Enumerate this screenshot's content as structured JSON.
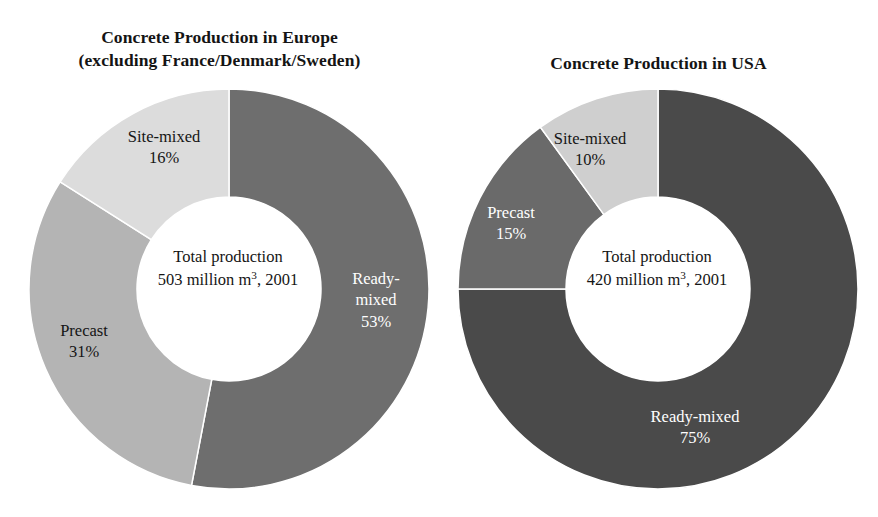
{
  "figure": {
    "background": "#ffffff"
  },
  "chart_data": [
    {
      "type": "pie",
      "variant": "donut",
      "id": "europe",
      "title": "Concrete Production in Europe\n(excluding France/Denmark/Sweden)",
      "title_line1": "Concrete Production in Europe",
      "title_line2": "(excluding France/Denmark/Sweden)",
      "center_line1": "Total production",
      "center_line2_prefix": "503 million m",
      "center_line2_sup": "3",
      "center_line2_suffix": ", 2001",
      "total_value": 503,
      "total_units": "million m3",
      "year": 2001,
      "start_angle_deg": 0,
      "direction": "clockwise",
      "legend": "inline-labels",
      "categories": [
        "Ready-mixed",
        "Precast",
        "Site-mixed"
      ],
      "values": [
        53,
        31,
        16
      ],
      "colors": [
        "#6e6e6e",
        "#b4b4b4",
        "#dcdcdc"
      ],
      "slices": [
        {
          "label": "Ready-mixed",
          "label_display": "Ready-\nmixed\n53%",
          "percent": 53,
          "percent_text": "53%",
          "color": "#6e6e6e",
          "text_color": "#ffffff"
        },
        {
          "label": "Precast",
          "label_display": "Precast\n31%",
          "percent": 31,
          "percent_text": "31%",
          "color": "#b4b4b4",
          "text_color": "#151515"
        },
        {
          "label": "Site-mixed",
          "label_display": "Site-mixed\n16%",
          "percent": 16,
          "percent_text": "16%",
          "color": "#dcdcdc",
          "text_color": "#151515"
        }
      ]
    },
    {
      "type": "pie",
      "variant": "donut",
      "id": "usa",
      "title": "Concrete Production in USA",
      "title_line1": "Concrete Production in USA",
      "center_line1": "Total production",
      "center_line2_prefix": "420 million m",
      "center_line2_sup": "3",
      "center_line2_suffix": ", 2001",
      "total_value": 420,
      "total_units": "million m3",
      "year": 2001,
      "start_angle_deg": 0,
      "direction": "clockwise",
      "legend": "inline-labels",
      "categories": [
        "Ready-mixed",
        "Precast",
        "Site-mixed"
      ],
      "values": [
        75,
        15,
        10
      ],
      "colors": [
        "#4a4a4a",
        "#6a6a6a",
        "#cfcfcf"
      ],
      "slices": [
        {
          "label": "Ready-mixed",
          "label_display": "Ready-mixed\n75%",
          "percent": 75,
          "percent_text": "75%",
          "color": "#4a4a4a",
          "text_color": "#ffffff"
        },
        {
          "label": "Precast",
          "label_display": "Precast\n15%",
          "percent": 15,
          "percent_text": "15%",
          "color": "#6a6a6a",
          "text_color": "#ffffff"
        },
        {
          "label": "Site-mixed",
          "label_display": "Site-mixed\n10%",
          "percent": 10,
          "percent_text": "10%",
          "color": "#cfcfcf",
          "text_color": "#151515"
        }
      ]
    }
  ]
}
